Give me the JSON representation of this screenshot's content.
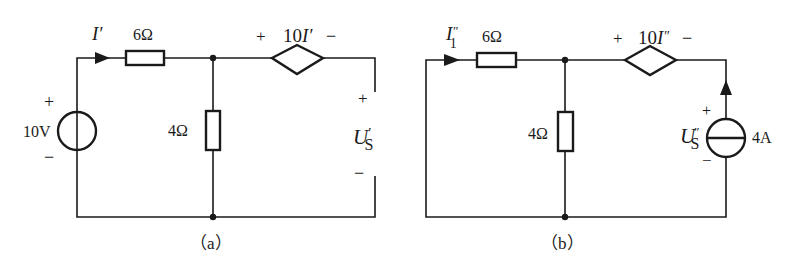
{
  "circuit_a": {
    "caption": "（a）",
    "current_label": {
      "main": "I",
      "prime": "′"
    },
    "series_resistor": "6Ω",
    "shunt_resistor": "4Ω",
    "voltage_source": {
      "value": "10V",
      "plus": "+",
      "minus": "−"
    },
    "dependent_source": {
      "plus": "+",
      "coef": "10",
      "var": "I",
      "prime": "′",
      "minus": "−"
    },
    "terminal_voltage": {
      "main": "U",
      "prime": "′",
      "sub": "S",
      "plus": "+",
      "minus": "−"
    }
  },
  "circuit_b": {
    "caption": "（b）",
    "current_label": {
      "main": "I",
      "prime": "″",
      "sub": "1"
    },
    "series_resistor": "6Ω",
    "shunt_resistor": "4Ω",
    "current_source": {
      "value": "4A"
    },
    "dependent_source": {
      "plus": "+",
      "coef": "10",
      "var": "I",
      "prime": "″",
      "minus": "−"
    },
    "source_voltage": {
      "main": "U",
      "prime": "″",
      "sub": "S",
      "plus": "+",
      "minus": "−"
    }
  },
  "colors": {
    "ink": "#1a1a1a",
    "background": "#ffffff"
  }
}
